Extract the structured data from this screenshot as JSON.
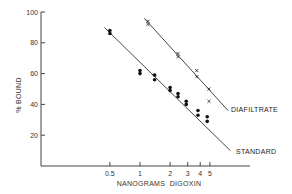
{
  "chart_data": {
    "type": "scatter",
    "title": "",
    "xlabel": "NANOGRAMS  DIGOXIN",
    "ylabel": "% BOUND",
    "xscale": "log",
    "xlim": [
      0.1,
      8
    ],
    "ylim": [
      0,
      100
    ],
    "grid": false,
    "legend_position": "inline labels at right end of fitted lines",
    "x_ticks": [
      0.5,
      1,
      2,
      3,
      4,
      5
    ],
    "x_tick_labels": [
      "0.5",
      "1",
      "2",
      "3",
      "4",
      "5"
    ],
    "y_ticks": [
      20,
      40,
      60,
      80,
      100
    ],
    "y_tick_labels": [
      "20",
      "40",
      "60",
      "80",
      "100"
    ],
    "series": [
      {
        "name": "STANDARD",
        "marker": "filled-circle",
        "color": "#111111",
        "points": [
          [
            0.5,
            88
          ],
          [
            0.5,
            86
          ],
          [
            1.0,
            62
          ],
          [
            1.0,
            60
          ],
          [
            1.4,
            59
          ],
          [
            1.4,
            56
          ],
          [
            2.0,
            51
          ],
          [
            2.0,
            49
          ],
          [
            2.4,
            47
          ],
          [
            2.4,
            45
          ],
          [
            2.9,
            42
          ],
          [
            2.9,
            40
          ],
          [
            3.8,
            36
          ],
          [
            3.8,
            33
          ],
          [
            4.7,
            32
          ],
          [
            4.7,
            29
          ]
        ],
        "fit_line": [
          [
            0.44,
            90
          ],
          [
            8.0,
            10
          ]
        ]
      },
      {
        "name": "DIAFILTRATE",
        "marker": "x",
        "color": "#111111",
        "points": [
          [
            1.2,
            94
          ],
          [
            1.2,
            92
          ],
          [
            2.4,
            73
          ],
          [
            2.4,
            71
          ],
          [
            3.7,
            62
          ],
          [
            3.7,
            58
          ],
          [
            4.9,
            50
          ],
          [
            4.9,
            42
          ]
        ],
        "fit_line": [
          [
            1.1,
            96
          ],
          [
            7.6,
            36
          ]
        ]
      }
    ]
  },
  "labels": {
    "standard": "STANDARD",
    "diafiltrate": "DIAFILTRATE",
    "xlabel": "NANOGRAMS  DIGOXIN",
    "ylabel": "% BOUND"
  }
}
